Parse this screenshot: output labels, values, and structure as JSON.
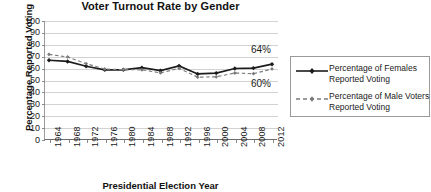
{
  "chart_data": {
    "type": "line",
    "title": "Voter Turnout Rate by Gender",
    "xlabel": "Presidential Election Year",
    "ylabel": "Percentage Reported Voting",
    "categories": [
      "1964",
      "1968",
      "1972",
      "1976",
      "1980",
      "1984",
      "1988",
      "1992",
      "1996",
      "2000",
      "2004",
      "2008",
      "2012"
    ],
    "ylim": [
      0,
      100
    ],
    "ytick_step": 10,
    "yticks": [
      "100",
      "90",
      "80",
      "70",
      "60",
      "50",
      "40",
      "30",
      "20",
      "10",
      "0"
    ],
    "grid": true,
    "legend_position": "right",
    "series": [
      {
        "name": "Percentage of Females Reported Voting",
        "values": [
          67,
          66,
          62,
          59,
          59,
          60.8,
          58.3,
          62.3,
          55.5,
          56.2,
          60.1,
          60.4,
          63.7
        ],
        "color": "#1c1c1c",
        "style": "solid",
        "marker": "diamond"
      },
      {
        "name": "Percentage of Male Voters Reported Voting",
        "values": [
          71.9,
          69.8,
          64.1,
          59.6,
          59.1,
          59.0,
          56.4,
          60.2,
          52.8,
          53.1,
          56.3,
          55.7,
          59.7
        ],
        "color": "#7a7a7a",
        "style": "dashed",
        "marker": "diamond"
      }
    ],
    "annotations": [
      {
        "text": "64%",
        "series": "Percentage of Females Reported Voting",
        "at": "2012"
      },
      {
        "text": "60%",
        "series": "Percentage of Male Voters Reported Voting",
        "at": "2012"
      }
    ]
  },
  "legend": {
    "items": [
      {
        "label_line1": "Percentage of Females",
        "label_line2": "Reported Voting"
      },
      {
        "label_line1": "Percentage of Male Voters",
        "label_line2": "Reported Voting"
      }
    ]
  }
}
